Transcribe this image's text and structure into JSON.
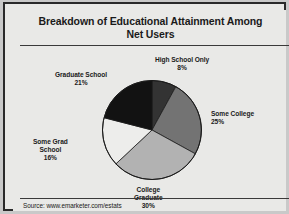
{
  "chart_data": {
    "type": "pie",
    "title": "Breakdown of Educational Attainment Among Net Users",
    "title_line1": "Breakdown of Educational Attainment Among",
    "title_line2": "Net Users",
    "categories": [
      "High School Only",
      "Some College",
      "College Graduate",
      "Some Grad School",
      "Graduate School"
    ],
    "values": [
      8,
      25,
      30,
      16,
      21
    ],
    "value_labels": [
      "8%",
      "25%",
      "30%",
      "16%",
      "21%"
    ],
    "unit": "%",
    "slice_colors": [
      "#333333",
      "#737373",
      "#b2b2b2",
      "#ededeb",
      "#121212"
    ],
    "start_angle_deg": 0,
    "direction": "clockwise",
    "legend": "none",
    "grid": false,
    "slices": [
      {
        "label": "High School Only",
        "value": 8,
        "value_label": "8%",
        "color": "#333333"
      },
      {
        "label": "Some College",
        "value": 25,
        "value_label": "25%",
        "color": "#737373"
      },
      {
        "label": "College Graduate",
        "value": 30,
        "value_label": "30%",
        "color": "#b2b2b2"
      },
      {
        "label": "Some Grad School",
        "value": 16,
        "value_label": "16%",
        "color": "#ededeb"
      },
      {
        "label": "Graduate School",
        "value": 21,
        "value_label": "21%",
        "color": "#121212"
      }
    ],
    "source": "Source: www.emarketer.com/estats"
  },
  "labels": {
    "high_school_line1": "High School Only",
    "high_school_pct": "8%",
    "some_college_line1": "Some College",
    "some_college_pct": "25%",
    "college_grad_line1": "College",
    "college_grad_line2": "Graduate",
    "college_grad_pct": "30%",
    "some_grad_line1": "Some Grad",
    "some_grad_line2": "School",
    "some_grad_pct": "16%",
    "grad_school_line1": "Graduate School",
    "grad_school_pct": "21%"
  },
  "footer": {
    "source": "Source: www.emarketer.com/estats"
  },
  "style": {
    "background": "#e9e9e7",
    "border": "#2a2a2a",
    "text": "#1a1a1a"
  }
}
